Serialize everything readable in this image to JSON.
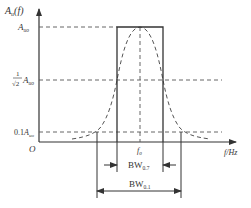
{
  "diagram": {
    "y_axis": {
      "label_main": "A",
      "label_sub": "u",
      "label_arg": "(f)"
    },
    "x_axis": {
      "label": "f/Hz"
    },
    "origin_label": "O",
    "levels": {
      "peak": {
        "main": "A",
        "sub": "uo"
      },
      "half_power": {
        "frac_num": "1",
        "frac_den": "√2",
        "main": "A",
        "sub": "uo"
      },
      "tenth": {
        "prefix": "0.1",
        "main": "A",
        "sub": "uo"
      }
    },
    "center_freq": {
      "main": "f",
      "sub": "0"
    },
    "bandwidths": [
      {
        "main": "BW",
        "sub": "0.7"
      },
      {
        "main": "BW",
        "sub": "0.1"
      }
    ],
    "colors": {
      "line": "#333333",
      "dashed": "#555555"
    }
  }
}
